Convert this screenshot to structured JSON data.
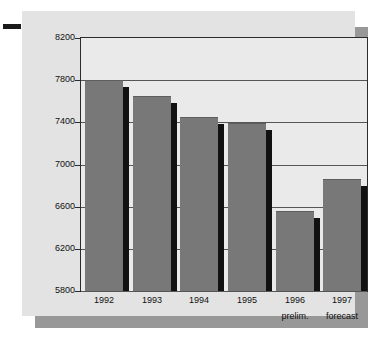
{
  "chart_data": {
    "type": "bar",
    "title": "",
    "subtitle": "",
    "xlabel": "",
    "ylabel": "",
    "categories": [
      "1992",
      "1993",
      "1994",
      "1995",
      "1996",
      "1997"
    ],
    "category_sublabels": [
      "",
      "",
      "",
      "",
      "prelim.",
      "forecast"
    ],
    "values": [
      7800,
      7650,
      7450,
      7390,
      6560,
      6860
    ],
    "ylim": [
      5800,
      8200
    ],
    "yticks": [
      5800,
      6200,
      6600,
      7000,
      7400,
      7800,
      8200
    ],
    "ytick_labels": [
      "5800",
      "6200",
      "6600",
      "7000",
      "7400",
      "7800",
      "8200"
    ],
    "grid": true,
    "legend": null,
    "series": [
      {
        "name": "value",
        "values": [
          7800,
          7650,
          7450,
          7390,
          6560,
          6860
        ]
      }
    ],
    "colors": {
      "bar_fill": "#787878",
      "bar_shadow": "#111111",
      "plot_background": "#eaeaea",
      "panel_background": "#e3e3e3",
      "panel_shadow": "#989898",
      "axis": "#2b2b2b",
      "gridline": "#555555",
      "text": "#101010"
    }
  },
  "marks": {
    "left_dash": ""
  }
}
